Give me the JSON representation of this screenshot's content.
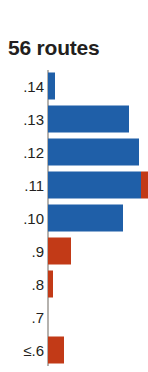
{
  "chart_title": "56 routes",
  "chart_data": {
    "type": "bar",
    "title": "56 routes",
    "xlabel": "",
    "ylabel": "",
    "orientation": "horizontal",
    "grid": false,
    "legend": false,
    "xlim": [
      0,
      101
    ],
    "colors": {
      "blue": "#1f5fa8",
      "red": "#c23a17",
      "axis": "#b5b2ae",
      "text": "#231f20",
      "background": "#ffffff"
    },
    "categories": [
      ".14",
      ".13",
      ".12",
      ".11",
      ".10",
      ".9",
      ".8",
      ".7",
      "≤.6"
    ],
    "series": [
      {
        "name": "blue",
        "color": "#1f5fa8",
        "values": [
          7,
          81,
          91,
          93,
          75,
          0,
          0,
          0,
          0
        ]
      },
      {
        "name": "red",
        "color": "#c23a17",
        "values": [
          0,
          0,
          0,
          8,
          0,
          23,
          5,
          0,
          16
        ]
      }
    ],
    "bars": [
      {
        "label": ".14",
        "blue": 7,
        "red": 0
      },
      {
        "label": ".13",
        "blue": 81,
        "red": 0
      },
      {
        "label": ".12",
        "blue": 91,
        "red": 0
      },
      {
        "label": ".11",
        "blue": 93,
        "red": 8
      },
      {
        "label": ".10",
        "blue": 75,
        "red": 0
      },
      {
        "label": ".9",
        "blue": 0,
        "red": 23
      },
      {
        "label": ".8",
        "blue": 0,
        "red": 5
      },
      {
        "label": ".7",
        "blue": 0,
        "red": 0
      },
      {
        "label": "≤.6",
        "blue": 0,
        "red": 16
      }
    ]
  }
}
